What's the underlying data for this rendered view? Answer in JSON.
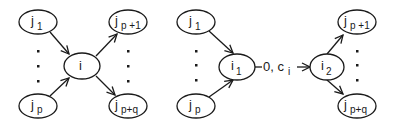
{
  "colors": {
    "stroke": "#1a1a1a",
    "background": "#ffffff"
  },
  "left_diagram": {
    "nodes": {
      "j1": {
        "base": "j",
        "sub": "1"
      },
      "jp": {
        "base": "j",
        "sub": "p"
      },
      "i": {
        "base": "i",
        "sub": ""
      },
      "jp1": {
        "base": "j",
        "sub": "p +1"
      },
      "jpq": {
        "base": "j",
        "sub": "p+q"
      }
    },
    "edges": [
      "j1 -> i",
      "jp -> i",
      "i -> jp1",
      "i -> jpq"
    ]
  },
  "right_diagram": {
    "nodes": {
      "j1": {
        "base": "j",
        "sub": "1"
      },
      "jp": {
        "base": "j",
        "sub": "p"
      },
      "i1": {
        "base": "i",
        "sub": "1"
      },
      "i2": {
        "base": "i",
        "sub": "2"
      },
      "jp1": {
        "base": "j",
        "sub": "p +1"
      },
      "jpq": {
        "base": "j",
        "sub": "p+q"
      }
    },
    "edge_label": {
      "text": "0, c",
      "sub": "i"
    },
    "edges": [
      "j1 -> i1",
      "jp -> i1",
      "i1 -> i2",
      "i2 -> jp1",
      "i2 -> jpq"
    ]
  }
}
